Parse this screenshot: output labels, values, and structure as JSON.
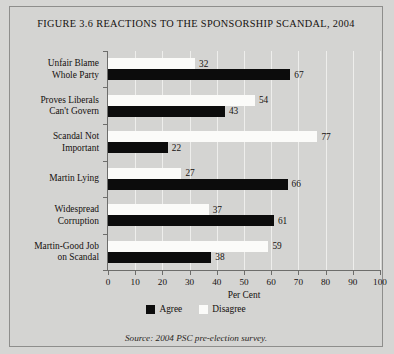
{
  "figure": {
    "title": "FIGURE 3.6 REACTIONS TO THE SPONSORSHIP SCANDAL, 2004",
    "source": "Source: 2004 PSC pre-election survey."
  },
  "legend": {
    "position": "bottom-center",
    "entries": [
      {
        "label": "Agree",
        "color": "#0c0c0c"
      },
      {
        "label": "Disagree",
        "color": "#fbfbf9"
      }
    ]
  },
  "chart_data": {
    "type": "bar",
    "orientation": "horizontal",
    "title": "FIGURE 3.6 REACTIONS TO THE SPONSORSHIP SCANDAL, 2004",
    "xlabel": "Per Cent",
    "ylabel": "",
    "xlim": [
      0,
      100
    ],
    "xticks": [
      0,
      10,
      20,
      30,
      40,
      50,
      60,
      70,
      80,
      90,
      100
    ],
    "xticklabels": [
      "0",
      "10",
      "20",
      "30",
      "40",
      "50",
      "60",
      "70",
      "80",
      "90",
      "100"
    ],
    "grid": true,
    "grid_axis": "x",
    "categories": [
      "Unfair Blame Whole Party",
      "Proves Liberals Can't Govern",
      "Scandal Not Important",
      "Martin Lying",
      "Widespread Corruption",
      "Martin-Good Job on Scandal"
    ],
    "category_lines": [
      [
        "Unfair Blame",
        "Whole Party"
      ],
      [
        "Proves Liberals",
        "Can't Govern"
      ],
      [
        "Scandal Not",
        "Important"
      ],
      [
        "Martin Lying"
      ],
      [
        "Widespread",
        "Corruption"
      ],
      [
        "Martin-Good Job",
        "on Scandal"
      ]
    ],
    "series": [
      {
        "name": "Agree",
        "color": "#0c0c0c",
        "values": [
          67,
          43,
          22,
          66,
          61,
          38
        ]
      },
      {
        "name": "Disagree",
        "color": "#fbfbf9",
        "values": [
          32,
          54,
          77,
          27,
          37,
          59
        ]
      }
    ]
  }
}
